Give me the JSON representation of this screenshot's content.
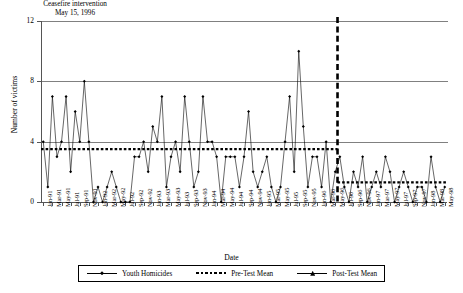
{
  "annotation": {
    "line1": "Ceasefire intervention",
    "line2": "May 15, 1996"
  },
  "axes": {
    "ylabel": "Number of victims",
    "xlabel": "Date",
    "yticks": [
      "0",
      "4",
      "8",
      "12"
    ]
  },
  "legend": {
    "items": [
      {
        "label": "Youth Homicides",
        "style": "line-marker"
      },
      {
        "label": "Pre-Test Mean",
        "style": "dotted"
      },
      {
        "label": "Post-Test Mean",
        "style": "line-marker"
      }
    ]
  },
  "chart_data": {
    "type": "line",
    "title": "",
    "xlabel": "Date",
    "ylabel": "Number of victims",
    "ylim": [
      0,
      12
    ],
    "yticks": [
      0,
      4,
      8,
      12
    ],
    "grid": true,
    "legend_position": "bottom",
    "tick_labels": [
      "Jan-91",
      "Mar-91",
      "May-91",
      "Jul-91",
      "Sep-91",
      "Nov-91",
      "Jan-92",
      "Mar-92",
      "May-92",
      "Jul-92",
      "Sep-92",
      "Nov-92",
      "Jan-93",
      "Mar-93",
      "May-93",
      "Jul-93",
      "Sep-93",
      "Nov-93",
      "Jan-94",
      "Mar-94",
      "May-94",
      "Jul-94",
      "Sep-94",
      "Nov-94",
      "Jan-95",
      "Mar-95",
      "May-95",
      "Jul-95",
      "Sep-95",
      "Nov-95",
      "Jan-96",
      "Mar-96",
      "May-96",
      "Jul-96",
      "Sep-96",
      "Nov-96",
      "Jan-97",
      "Mar-97",
      "May-97",
      "Jul-97",
      "Sep-97",
      "Nov-97",
      "Jan-98",
      "Mar-98",
      "May-98"
    ],
    "x_months": [
      "Jan-91",
      "Feb-91",
      "Mar-91",
      "Apr-91",
      "May-91",
      "Jun-91",
      "Jul-91",
      "Aug-91",
      "Sep-91",
      "Oct-91",
      "Nov-91",
      "Dec-91",
      "Jan-92",
      "Feb-92",
      "Mar-92",
      "Apr-92",
      "May-92",
      "Jun-92",
      "Jul-92",
      "Aug-92",
      "Sep-92",
      "Oct-92",
      "Nov-92",
      "Dec-92",
      "Jan-93",
      "Feb-93",
      "Mar-93",
      "Apr-93",
      "May-93",
      "Jun-93",
      "Jul-93",
      "Aug-93",
      "Sep-93",
      "Oct-93",
      "Nov-93",
      "Dec-93",
      "Jan-94",
      "Feb-94",
      "Mar-94",
      "Apr-94",
      "May-94",
      "Jun-94",
      "Jul-94",
      "Aug-94",
      "Sep-94",
      "Oct-94",
      "Nov-94",
      "Dec-94",
      "Jan-95",
      "Feb-95",
      "Mar-95",
      "Apr-95",
      "May-95",
      "Jun-95",
      "Jul-95",
      "Aug-95",
      "Sep-95",
      "Oct-95",
      "Nov-95",
      "Dec-95",
      "Jan-96",
      "Feb-96",
      "Mar-96",
      "Apr-96",
      "May-96",
      "Jun-96",
      "Jul-96",
      "Aug-96",
      "Sep-96",
      "Oct-96",
      "Nov-96",
      "Dec-96",
      "Jan-97",
      "Feb-97",
      "Mar-97",
      "Apr-97",
      "May-97",
      "Jun-97",
      "Jul-97",
      "Aug-97",
      "Sep-97",
      "Oct-97",
      "Nov-97",
      "Dec-97",
      "Jan-98",
      "Feb-98",
      "Mar-98",
      "Apr-98",
      "May-98"
    ],
    "series": [
      {
        "name": "Youth Homicides",
        "values": [
          4,
          1,
          7,
          3,
          4,
          7,
          2,
          6,
          4,
          8,
          4,
          0,
          1,
          0,
          1,
          2,
          1,
          0,
          0,
          0,
          3,
          3,
          4,
          2,
          5,
          4,
          7,
          1,
          3,
          4,
          2,
          7,
          4,
          1,
          2,
          7,
          4,
          4,
          3,
          0,
          3,
          3,
          3,
          1,
          3,
          6,
          2,
          1,
          2,
          3,
          1,
          0,
          1,
          4,
          7,
          2,
          10,
          5,
          1,
          3,
          3,
          1,
          4,
          0,
          2,
          3,
          1,
          0,
          2,
          1,
          3,
          0,
          1,
          2,
          1,
          3,
          2,
          0,
          1,
          2,
          1,
          0,
          1,
          1,
          0,
          3,
          1,
          0,
          1
        ]
      },
      {
        "name": "Pre-Test Mean",
        "value": 3.5,
        "span": [
          "Jan-91",
          "May-96"
        ]
      },
      {
        "name": "Post-Test Mean",
        "value": 1.3,
        "span": [
          "Jun-96",
          "May-98"
        ]
      }
    ],
    "intervention": {
      "label": "Ceasefire intervention",
      "date": "May 15, 1996",
      "style": "dashed-vertical"
    }
  }
}
